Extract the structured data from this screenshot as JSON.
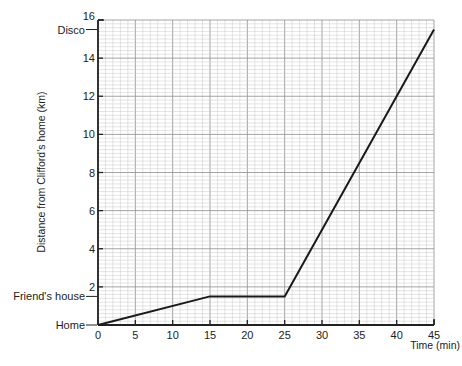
{
  "chart_data": {
    "type": "line",
    "title": "",
    "xlabel": "Time (min)",
    "ylabel": "Distance from Clifford's home (km)",
    "xlim": [
      0,
      45
    ],
    "ylim": [
      0,
      16
    ],
    "grid": true,
    "x_ticks": [
      0,
      5,
      10,
      15,
      20,
      25,
      30,
      35,
      40,
      45
    ],
    "y_ticks": [
      2,
      4,
      6,
      8,
      10,
      12,
      14,
      16
    ],
    "annotations": [
      {
        "label": "Home",
        "y": 0
      },
      {
        "label": "Friend's house",
        "y": 1.5
      },
      {
        "label": "Disco",
        "y": 15.5
      }
    ],
    "series": [
      {
        "name": "Clifford's journey",
        "x": [
          0,
          15,
          25,
          45
        ],
        "y": [
          0,
          1.5,
          1.5,
          15.5
        ]
      }
    ]
  },
  "colors": {
    "grid_minor": "#c8c8c8",
    "grid_major": "#9a9a9a",
    "axis": "#222222",
    "line": "#1a1a1a"
  }
}
